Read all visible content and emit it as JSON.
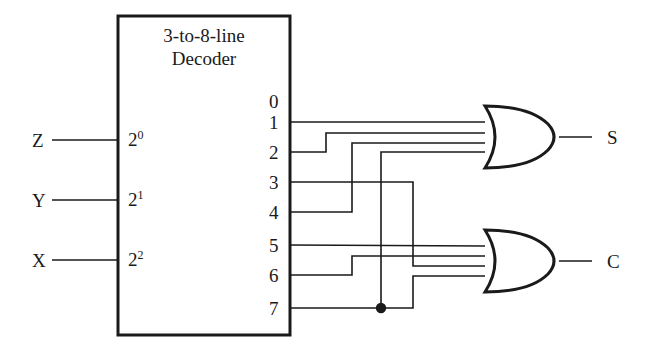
{
  "diagram": {
    "title_line1": "3-to-8-line",
    "title_line2": "Decoder",
    "block": {
      "x": 118,
      "y": 16,
      "w": 172,
      "h": 319
    },
    "inputs": [
      {
        "name": "Z",
        "pin": "2",
        "exp": "0",
        "y": 140,
        "label_x": 32,
        "pin_x": 128
      },
      {
        "name": "Y",
        "pin": "2",
        "exp": "1",
        "y": 200,
        "label_x": 32,
        "pin_x": 128
      },
      {
        "name": "X",
        "pin": "2",
        "exp": "2",
        "y": 260,
        "label_x": 32,
        "pin_x": 128
      }
    ],
    "outputs": [
      {
        "num": "0",
        "y": 101,
        "wired": false
      },
      {
        "num": "1",
        "y": 122,
        "wired": true
      },
      {
        "num": "2",
        "y": 152,
        "wired": true
      },
      {
        "num": "3",
        "y": 182,
        "wired": true
      },
      {
        "num": "4",
        "y": 212,
        "wired": true
      },
      {
        "num": "5",
        "y": 245,
        "wired": true
      },
      {
        "num": "6",
        "y": 275,
        "wired": true
      },
      {
        "num": "7",
        "y": 308,
        "wired": true
      }
    ],
    "gates": [
      {
        "id": "sum-gate",
        "type": "OR",
        "output_label": "S",
        "cx": 485,
        "cy": 137,
        "w": 75,
        "h": 62,
        "out_wire_end": 592,
        "label_x": 607,
        "inputs_from": [
          "1",
          "2",
          "4",
          "7"
        ],
        "input_ys": [
          122,
          133,
          143,
          152
        ]
      },
      {
        "id": "carry-gate",
        "type": "OR",
        "output_label": "C",
        "cx": 485,
        "cy": 261,
        "w": 75,
        "h": 62,
        "out_wire_end": 592,
        "label_x": 607,
        "inputs_from": [
          "3",
          "5",
          "6",
          "7"
        ],
        "input_ys": [
          246,
          256,
          266,
          276
        ]
      }
    ],
    "junction": {
      "x": 381,
      "y": 308,
      "on_wire": "7"
    },
    "wire_color": "#1a1a1a",
    "routes": {
      "w1": "M290,122 L485,122",
      "w2": "M290,152 L326,152 L326,133 L485,133",
      "w3": "M290,182 L413,182 L413,266 L485,266",
      "w4": "M290,212 L352,212 L352,143 L485,143",
      "w5": "M290,245 L485,246",
      "w6": "M290,275 L352,275 L352,256 L485,256",
      "w7": "M290,308 L413,308 L413,276 L485,276",
      "w7b": "M381,308 L381,152 L485,152"
    }
  }
}
